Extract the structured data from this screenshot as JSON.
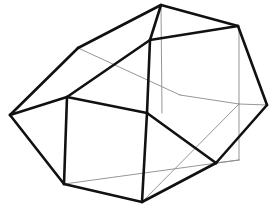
{
  "figure": {
    "type": "line-drawing",
    "background_color": "#ffffff",
    "canvas": {
      "width": 275,
      "height": 209
    },
    "stroke": {
      "visible_color": "#111111",
      "visible_width": 2.6,
      "hidden_color": "#8a8a8a",
      "hidden_width": 0.9
    },
    "vertices": {
      "apex_top": [
        161,
        5
      ],
      "upper_left": [
        78,
        48
      ],
      "upper_mid": [
        150,
        40
      ],
      "upper_right": [
        238,
        26
      ],
      "left": [
        10,
        115
      ],
      "left_mid": [
        67,
        97
      ],
      "center": [
        147,
        113
      ],
      "right": [
        267,
        105
      ],
      "lower_left": [
        64,
        184
      ],
      "lower_right": [
        216,
        163
      ],
      "bottom": [
        142,
        202
      ],
      "back_upper": [
        239,
        27
      ],
      "back_mid": [
        239,
        104
      ],
      "back_low": [
        239,
        160
      ],
      "back_left_top": [
        180,
        95
      ],
      "back_bottom": [
        186,
        176
      ]
    },
    "edges_visible": [
      {
        "name": "apex-to-upper-left",
        "d": "M 161 5 L 78 48"
      },
      {
        "name": "upper-left-to-left",
        "d": "M 78 48 L 10 115"
      },
      {
        "name": "left-to-left-mid",
        "d": "M 10 115 L 67 97"
      },
      {
        "name": "left-to-lower-left",
        "d": "M 10 115 L 64 184"
      },
      {
        "name": "left-mid-to-upper-mid",
        "d": "M 67 97 L 150 40"
      },
      {
        "name": "left-mid-vertical",
        "d": "M 67 97 L 64 184"
      },
      {
        "name": "left-mid-to-center",
        "d": "M 67 97 L 147 113"
      },
      {
        "name": "apex-to-upper-mid",
        "d": "M 161 5 L 150 40"
      },
      {
        "name": "upper-mid-to-upper-right",
        "d": "M 150 40 L 238 26"
      },
      {
        "name": "apex-to-upper-right",
        "d": "M 161 5 L 238 26"
      },
      {
        "name": "upper-mid-to-center",
        "d": "M 150 40 L 147 113"
      },
      {
        "name": "center-to-bottom",
        "d": "M 147 113 L 142 202"
      },
      {
        "name": "center-to-lower-right",
        "d": "M 147 113 L 216 163"
      },
      {
        "name": "upper-right-to-right",
        "d": "M 238 26 L 267 105"
      },
      {
        "name": "right-to-lower-right",
        "d": "M 267 105 L 216 163"
      },
      {
        "name": "lower-right-to-bottom",
        "d": "M 216 163 L 142 202"
      },
      {
        "name": "bottom-to-lower-left",
        "d": "M 142 202 L 64 184"
      }
    ],
    "edges_hidden": [
      {
        "name": "upper-left-to-back-left-top",
        "d": "M 78 48 L 180 95"
      },
      {
        "name": "back-left-top-to-back-mid",
        "d": "M 180 95 L 239 104"
      },
      {
        "name": "back-upper-vertical",
        "d": "M 239 27 L 239 104"
      },
      {
        "name": "back-lower-vertical",
        "d": "M 239 104 L 239 160"
      },
      {
        "name": "back-mid-to-right",
        "d": "M 239 104 L 267 105"
      },
      {
        "name": "lower-left-to-back-low",
        "d": "M 64 184 L 239 160"
      },
      {
        "name": "bottom-to-back-mid",
        "d": "M 142 202 L 239 104"
      },
      {
        "name": "apex-vertical-hidden",
        "d": "M 161 5 L 162 113"
      },
      {
        "name": "back-low-to-lower-right",
        "d": "M 239 160 L 216 163"
      }
    ]
  }
}
